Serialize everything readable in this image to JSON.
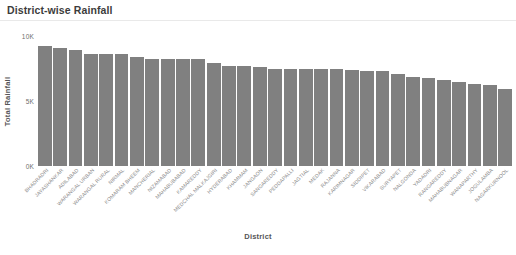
{
  "chart_title": "District-wise Rainfall",
  "axis_titles": {
    "x": "District",
    "y": "Total Rainfall"
  },
  "colors": {
    "bar": "#808080",
    "title_text": "#3c3c3c",
    "tick_text": "#8a8a8a",
    "axis_title": "#555555"
  },
  "chart_data": {
    "type": "bar",
    "title": "District-wise Rainfall",
    "xlabel": "District",
    "ylabel": "Total Rainfall",
    "ylim": [
      0,
      10000
    ],
    "ytick_labels": [
      "0K",
      "5K",
      "10K"
    ],
    "ytick_values": [
      0,
      5000,
      10000
    ],
    "grid": false,
    "legend": false,
    "categories": [
      "BHADRADRI",
      "JAYASHANKAR",
      "ADILABAD",
      "WARANGAL URBAN",
      "WARANGAL RURAL",
      "NIRMAL",
      "KOMARAM BHEEM",
      "MANCHERIAL",
      "NIZAMABAD",
      "MAHABUBABAD",
      "KAMAREDDY",
      "MEDCHAL MALKAJGIRI",
      "HYDERABAD",
      "KHAMMAM",
      "JANGAON",
      "SANGAREDDY",
      "PEDDAPALLI",
      "JAGTIAL",
      "MEDAK",
      "RAJANNA",
      "KARIMNAGAR",
      "SIDDIPET",
      "VIKARABAD",
      "SURYAPET",
      "NALGONDA",
      "YADADRI",
      "RANGAREDDY",
      "MAHABUBNAGAR",
      "WANAPARTHY",
      "JOGULAMBA",
      "NAGARKURNOOL"
    ],
    "values": [
      9250,
      9050,
      8900,
      8650,
      8600,
      8580,
      8350,
      8250,
      8250,
      8200,
      8200,
      7900,
      7700,
      7680,
      7620,
      7500,
      7480,
      7470,
      7450,
      7440,
      7380,
      7300,
      7280,
      7050,
      6880,
      6750,
      6620,
      6450,
      6320,
      6200,
      5900
    ]
  }
}
